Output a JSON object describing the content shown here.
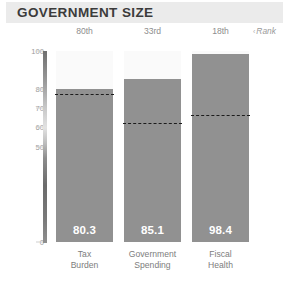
{
  "header": {
    "title": "GOVERNMENT SIZE"
  },
  "rank_row": {
    "annotation_caret": "‹",
    "annotation_label": "Rank",
    "ranks": [
      "80th",
      "33rd",
      "18th"
    ]
  },
  "axis": {
    "ticks": [
      "100",
      "80",
      "70",
      "60",
      "50",
      "0"
    ]
  },
  "colors": {
    "banner": "#ebebeb",
    "title_text": "#3b3b3b",
    "bar": "#919191",
    "bar_track": "#fafafa",
    "dash_line": "#1c1c1c",
    "tick_text": "#9b9b9b",
    "category_text": "#7d7d7d",
    "value_text": "#ffffff"
  },
  "chart_data": {
    "type": "bar",
    "title": "GOVERNMENT SIZE",
    "xlabel": "",
    "ylabel": "",
    "ylim": [
      0,
      100
    ],
    "grid": false,
    "legend": "none",
    "yticks": [
      0,
      50,
      60,
      70,
      80,
      100
    ],
    "categories": [
      "Tax Burden",
      "Government Spending",
      "Fiscal Health"
    ],
    "category_lines": [
      [
        "Tax",
        "Burden"
      ],
      [
        "Government",
        "Spending"
      ],
      [
        "Fiscal",
        "Health"
      ]
    ],
    "values": [
      80.3,
      85.1,
      98.4
    ],
    "value_labels": [
      "80.3",
      "85.1",
      "98.4"
    ],
    "ranks": [
      "80th",
      "33rd",
      "18th"
    ],
    "reference_lines": [
      77.0,
      62.0,
      66.0
    ],
    "reference_line_style": "dashed",
    "annotations": [
      "‹ Rank"
    ]
  }
}
